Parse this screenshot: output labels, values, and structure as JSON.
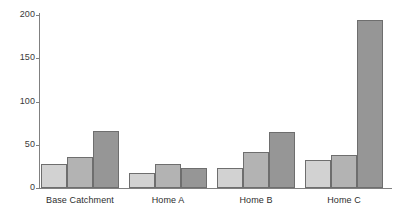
{
  "chart_data": {
    "type": "bar",
    "title": "",
    "subtitle": "",
    "xlabel": "",
    "ylabel": "",
    "categories": [
      "Base Catchment",
      "Home A",
      "Home B",
      "Home C"
    ],
    "series": [
      {
        "name": "Series 1",
        "values": [
          28,
          17,
          23,
          32
        ],
        "color": "#d2d2d2"
      },
      {
        "name": "Series 2",
        "values": [
          36,
          28,
          42,
          38
        ],
        "color": "#b3b3b3"
      },
      {
        "name": "Series 3",
        "values": [
          66,
          23,
          65,
          194
        ],
        "color": "#969696"
      }
    ],
    "ylim": [
      0,
      200
    ],
    "yticks": [
      0,
      50,
      100,
      150,
      200
    ],
    "ytick_labels": [
      "0",
      "50",
      "100",
      "150",
      "200"
    ],
    "grid": false,
    "legend": "none",
    "axis_color": "#808080",
    "bar_edge_color": "#6e6e6e",
    "background": "#ffffff"
  }
}
